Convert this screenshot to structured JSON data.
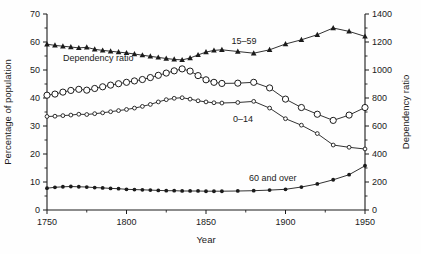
{
  "figure": {
    "background": "#fefefe",
    "ink": "#1b1b1b"
  },
  "chart_data": {
    "type": "line",
    "title": "",
    "xlabel": "Year",
    "ylabel_left": "Percentage of population",
    "ylabel_right": "Dependency ratio",
    "grid": false,
    "legend_position": "inline-annotations",
    "x_range": [
      1750,
      1950
    ],
    "x_ticks": [
      1750,
      1800,
      1850,
      1900,
      1950
    ],
    "x_minor_ticks": [
      1775,
      1825,
      1875,
      1925
    ],
    "y_left_range": [
      0,
      70
    ],
    "y_left_ticks": [
      0,
      10,
      20,
      30,
      40,
      50,
      60,
      70
    ],
    "y_left_minor_ticks": [
      5,
      15,
      25,
      35,
      45,
      55,
      65
    ],
    "y_right_range": [
      0,
      1400
    ],
    "y_right_ticks": [
      0,
      200,
      400,
      600,
      800,
      1000,
      1200,
      1400
    ],
    "y_right_minor_ticks": [
      100,
      300,
      500,
      700,
      900,
      1100,
      1300
    ],
    "years": [
      1750,
      1755,
      1760,
      1765,
      1770,
      1775,
      1780,
      1785,
      1790,
      1795,
      1800,
      1805,
      1810,
      1815,
      1820,
      1825,
      1830,
      1835,
      1840,
      1845,
      1850,
      1855,
      1860,
      1870,
      1880,
      1890,
      1900,
      1910,
      1920,
      1930,
      1940,
      1950
    ],
    "series": [
      {
        "name": "15–59",
        "axis": "left",
        "marker": "filled-triangle",
        "values": [
          59.2,
          58.8,
          58.5,
          58.2,
          57.9,
          58.1,
          57.4,
          57.0,
          56.7,
          56.4,
          56.1,
          55.7,
          55.3,
          54.9,
          54.5,
          54.1,
          53.8,
          53.6,
          54.3,
          55.4,
          56.4,
          57.0,
          57.2,
          56.6,
          56.0,
          57.2,
          59.3,
          60.8,
          62.6,
          65.0,
          63.8,
          62.0
        ],
        "label": {
          "text": "15–59",
          "year": 1866,
          "value": 59.2
        }
      },
      {
        "name": "Dependency ratio",
        "axis": "right",
        "marker": "open-circle-large",
        "values": [
          820,
          828,
          842,
          854,
          862,
          856,
          868,
          880,
          892,
          902,
          912,
          922,
          932,
          946,
          962,
          978,
          994,
          1008,
          992,
          960,
          930,
          912,
          904,
          906,
          912,
          872,
          792,
          732,
          684,
          640,
          678,
          732
        ],
        "label": {
          "text": "Dependency ratio",
          "year": 1760,
          "value": 53.2
        }
      },
      {
        "name": "0–14",
        "axis": "left",
        "marker": "open-circle-small",
        "values": [
          33.4,
          33.5,
          33.7,
          33.9,
          34.2,
          34.1,
          34.4,
          34.7,
          35.1,
          35.5,
          35.9,
          36.4,
          37.0,
          37.7,
          38.6,
          39.4,
          39.9,
          40.1,
          39.6,
          39.0,
          38.6,
          38.3,
          38.2,
          38.4,
          38.8,
          36.4,
          32.6,
          30.3,
          27.3,
          23.2,
          22.4,
          21.8
        ],
        "label": {
          "text": "0–14",
          "year": 1867,
          "value": 31.3
        }
      },
      {
        "name": "60 and over",
        "axis": "left",
        "marker": "filled-circle",
        "values": [
          7.8,
          8.1,
          8.3,
          8.4,
          8.3,
          8.2,
          8.0,
          7.9,
          7.7,
          7.6,
          7.4,
          7.3,
          7.2,
          7.1,
          7.0,
          6.9,
          6.9,
          6.8,
          6.8,
          6.8,
          6.7,
          6.7,
          6.7,
          6.8,
          6.9,
          7.1,
          7.4,
          8.2,
          9.3,
          10.8,
          12.6,
          15.8
        ],
        "label": {
          "text": "60 and over",
          "year": 1877,
          "value": 10.3
        }
      }
    ]
  }
}
